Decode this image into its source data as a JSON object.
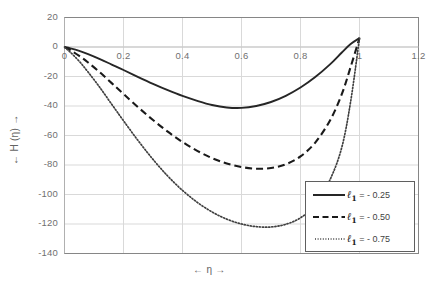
{
  "chart_data": {
    "type": "line",
    "title": "",
    "xlabel": "← η →",
    "ylabel": "← H (η) →",
    "xlim": [
      0,
      1.2
    ],
    "ylim": [
      -140,
      20
    ],
    "xticks": [
      "0",
      "0.2",
      "0.4",
      "0.6",
      "0.8",
      "1",
      "1.2"
    ],
    "xtick_values": [
      0,
      0.2,
      0.4,
      0.6,
      0.8,
      1,
      1.2
    ],
    "yticks": [
      "20",
      "0",
      "-20",
      "-40",
      "-60",
      "-80",
      "-100",
      "-120",
      "-140"
    ],
    "ytick_values": [
      20,
      0,
      -20,
      -40,
      -60,
      -80,
      -100,
      -120,
      -140
    ],
    "grid": true,
    "grid_color": "#d9d9d9",
    "frame_color": "#868686",
    "legend_position": "lower-right",
    "series": [
      {
        "name": "ℓ₁ = - 0.25",
        "style": "solid",
        "color": "#262626",
        "min_value": -41.5,
        "min_at_x": 0.52,
        "end_value": 6,
        "x": [
          0,
          0.02,
          0.05,
          0.08,
          0.12,
          0.16,
          0.2,
          0.25,
          0.3,
          0.35,
          0.4,
          0.45,
          0.5,
          0.55,
          0.6,
          0.65,
          0.7,
          0.75,
          0.8,
          0.85,
          0.9,
          0.94,
          0.97,
          1.0
        ],
        "y": [
          0,
          -0.9,
          -2.6,
          -4.8,
          -8.2,
          -11.9,
          -15.6,
          -20.4,
          -25.0,
          -29.3,
          -33.2,
          -36.5,
          -39.3,
          -41.0,
          -41.3,
          -40.0,
          -37.3,
          -33.1,
          -27.5,
          -20.4,
          -11.8,
          -3.7,
          2.0,
          6.0
        ]
      },
      {
        "name": "ℓ₁ = - 0.50",
        "style": "dashed",
        "color": "#1a1a1a",
        "min_value": -84,
        "min_at_x": 0.52,
        "end_value": 6,
        "x": [
          0,
          0.02,
          0.05,
          0.08,
          0.12,
          0.16,
          0.2,
          0.25,
          0.3,
          0.35,
          0.4,
          0.45,
          0.5,
          0.55,
          0.6,
          0.65,
          0.7,
          0.75,
          0.8,
          0.85,
          0.9,
          0.94,
          0.97,
          1.0
        ],
        "y": [
          0,
          -2.2,
          -6.0,
          -10.5,
          -17.2,
          -24.5,
          -31.8,
          -40.9,
          -49.5,
          -57.4,
          -64.4,
          -70.4,
          -75.3,
          -79.0,
          -81.4,
          -82.5,
          -82.0,
          -79.5,
          -74.2,
          -64.8,
          -49.8,
          -32.0,
          -13.5,
          6.0
        ]
      },
      {
        "name": "ℓ₁ = - 0.75",
        "style": "dotted",
        "color": "#404040",
        "min_value": -124,
        "min_at_x": 0.53,
        "end_value": 6,
        "x": [
          0,
          0.02,
          0.05,
          0.08,
          0.12,
          0.16,
          0.2,
          0.25,
          0.3,
          0.35,
          0.4,
          0.45,
          0.5,
          0.55,
          0.6,
          0.65,
          0.7,
          0.75,
          0.8,
          0.85,
          0.9,
          0.94,
          0.97,
          1.0
        ],
        "y": [
          0,
          -3.6,
          -9.7,
          -17.0,
          -27.5,
          -38.8,
          -50.0,
          -63.6,
          -76.2,
          -87.5,
          -97.2,
          -105.3,
          -111.8,
          -116.7,
          -120.0,
          -121.8,
          -122.0,
          -120.2,
          -115.8,
          -107.0,
          -90.0,
          -68.0,
          -37.0,
          6.0
        ]
      }
    ],
    "legend": [
      {
        "symbol": "ℓ",
        "subscript": "1",
        "equals": "= - 0.25",
        "style": "solid"
      },
      {
        "symbol": "ℓ",
        "subscript": "1",
        "equals": "= - 0.50",
        "style": "dashed"
      },
      {
        "symbol": "ℓ",
        "subscript": "1",
        "equals": "= - 0.75",
        "style": "dotted"
      }
    ]
  }
}
